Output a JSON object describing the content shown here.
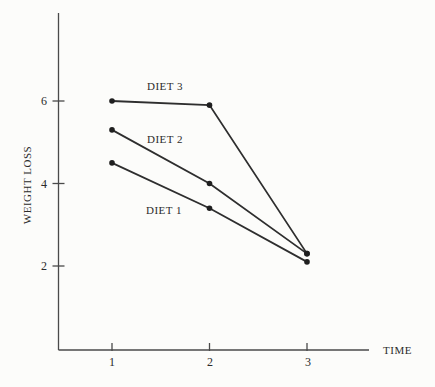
{
  "figure": {
    "background": "#fcfcfa",
    "ink_color": "#2e2e2e",
    "axis_color": "#4a4a4a"
  },
  "chart_data": {
    "type": "line",
    "title": "",
    "xlabel": "TIME",
    "ylabel": "WEIGHT LOSS",
    "x": [
      1,
      2,
      3
    ],
    "x_tick_labels": [
      "1",
      "2",
      "3"
    ],
    "y_tick_values": [
      2,
      4,
      6
    ],
    "y_tick_labels": [
      "2",
      "4",
      "6"
    ],
    "xlim": [
      0.45,
      3.65
    ],
    "ylim": [
      0,
      8.1
    ],
    "grid": false,
    "legend_position": "inline-annotations",
    "marker": "filled-circle",
    "line_color": "#2e2e2e",
    "series": [
      {
        "name": "DIET 1",
        "values": [
          4.5,
          3.4,
          2.1
        ]
      },
      {
        "name": "DIET 2",
        "values": [
          5.3,
          4.0,
          2.3
        ]
      },
      {
        "name": "DIET 3",
        "values": [
          6.0,
          5.9,
          2.3
        ]
      }
    ]
  }
}
